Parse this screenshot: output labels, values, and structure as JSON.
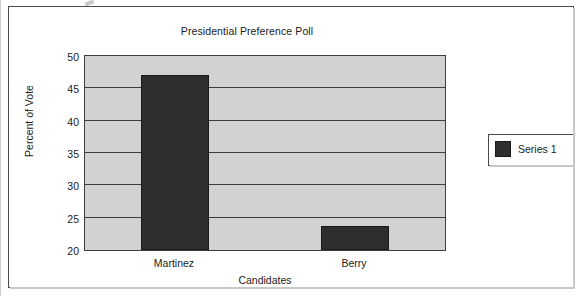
{
  "chart_data": {
    "type": "bar",
    "title": "Presidential Preference Poll",
    "xlabel": "Candidates",
    "ylabel": "Percent of Vote",
    "categories": [
      "Martinez",
      "Berry"
    ],
    "values": [
      47.1,
      23.7
    ],
    "series": [
      {
        "name": "Series 1",
        "values": [
          47.1,
          23.7
        ]
      }
    ],
    "ylim": [
      20,
      50
    ],
    "yticks": [
      20,
      25,
      30,
      35,
      40,
      45,
      50
    ],
    "grid": "horizontal",
    "legend_position": "right",
    "colors": {
      "bar": "#2e2e2e",
      "plot_background": "#d2d2d2",
      "gridline": "#3d3d3d",
      "frame": "#4a4a4a",
      "text": "#1b1b1b"
    }
  },
  "legend": {
    "entries": [
      {
        "label": "Series 1",
        "swatch_color": "#2e2e2e"
      }
    ]
  }
}
